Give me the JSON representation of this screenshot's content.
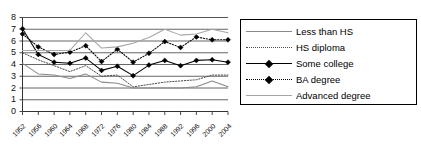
{
  "chart": {
    "title": "",
    "xlabel": "",
    "ylabel": ""
  },
  "axes": {
    "y_ticks": [
      "0",
      "1",
      "2",
      "3",
      "4",
      "5",
      "6",
      "7",
      "8"
    ],
    "x_ticks": [
      "1952",
      "1956",
      "1960",
      "1964",
      "1968",
      "1972",
      "1976",
      "1980",
      "1984",
      "1988",
      "1992",
      "1996",
      "2000",
      "2004"
    ]
  },
  "legend": {
    "items": [
      {
        "label": "Less than HS",
        "style": "solid",
        "marker": "none",
        "color": "#8a8a8a"
      },
      {
        "label": "HS diploma",
        "style": "dotted",
        "marker": "none",
        "color": "#4a4a4a"
      },
      {
        "label": "Some college",
        "style": "solid",
        "marker": "diamond",
        "color": "#000000"
      },
      {
        "label": "BA degree",
        "style": "dotted",
        "marker": "diamond",
        "color": "#000000"
      },
      {
        "label": "Advanced degree",
        "style": "solid",
        "marker": "none",
        "color": "#a6a6a6"
      }
    ]
  },
  "chart_data": {
    "type": "line",
    "title": "",
    "xlabel": "",
    "ylabel": "",
    "xlim": [
      1952,
      2004
    ],
    "ylim": [
      0,
      8
    ],
    "grid": true,
    "legend_position": "right",
    "x": [
      1952,
      1956,
      1960,
      1964,
      1968,
      1972,
      1976,
      1980,
      1984,
      1988,
      1992,
      1996,
      2000,
      2004
    ],
    "series": [
      {
        "name": "Less than HS",
        "color": "#8a8a8a",
        "style": "solid",
        "marker": "none",
        "values": [
          4.1,
          3.2,
          3.1,
          2.8,
          3.2,
          2.5,
          2.4,
          2.0,
          2.0,
          2.0,
          2.0,
          2.1,
          2.6,
          2.1
        ]
      },
      {
        "name": "HS diploma",
        "color": "#4a4a4a",
        "style": "dotted",
        "marker": "none",
        "values": [
          5.0,
          4.4,
          3.9,
          3.4,
          3.9,
          3.0,
          3.1,
          2.1,
          2.3,
          2.5,
          2.6,
          2.7,
          3.1,
          3.1
        ]
      },
      {
        "name": "Some college",
        "color": "#000000",
        "style": "solid",
        "marker": "diamond",
        "values": [
          7.05,
          4.85,
          4.2,
          4.1,
          4.55,
          3.5,
          3.85,
          3.05,
          3.95,
          4.35,
          3.9,
          4.35,
          4.4,
          4.2
        ]
      },
      {
        "name": "BA degree",
        "color": "#000000",
        "style": "dotted",
        "marker": "diamond",
        "values": [
          6.6,
          5.5,
          4.85,
          5.05,
          5.6,
          4.25,
          5.3,
          4.2,
          4.95,
          5.95,
          5.45,
          6.35,
          6.1,
          6.1
        ]
      },
      {
        "name": "Advanced degree",
        "color": "#a6a6a6",
        "style": "solid",
        "marker": "none",
        "values": [
          5.2,
          5.2,
          5.2,
          5.2,
          6.7,
          5.4,
          5.5,
          5.8,
          6.3,
          7.0,
          6.5,
          6.6,
          7.0,
          6.7
        ]
      }
    ]
  }
}
